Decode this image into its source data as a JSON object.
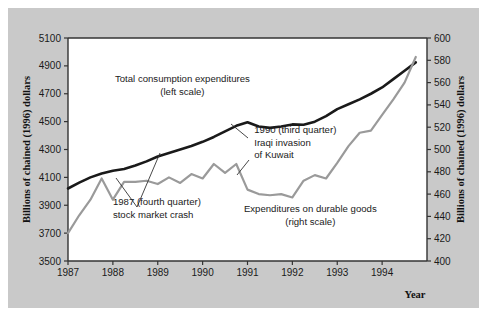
{
  "figure": {
    "background": "#c9c9c9",
    "plot_background": "#ffffff",
    "outer_margin_color": "#ffffff"
  },
  "chart_data": {
    "type": "line",
    "title": "",
    "xlabel": "Year",
    "ylabel": "Billions of chained (1996) dollars",
    "ylabel_right": "Billions of chained (1996) dollars",
    "grid": false,
    "legend": "inline-annotations",
    "xlim": [
      1987,
      1995
    ],
    "xticks": [
      1987,
      1988,
      1989,
      1990,
      1991,
      1992,
      1993,
      1994
    ],
    "xtick_labels": [
      "1987",
      "1988",
      "1989",
      "1990",
      "1991",
      "1992",
      "1993",
      "1994"
    ],
    "ylim": [
      3500,
      5100
    ],
    "yticks": [
      3500,
      3700,
      3900,
      4100,
      4300,
      4500,
      4700,
      4900,
      5100
    ],
    "ytick_labels": [
      "3500",
      "3700",
      "3900",
      "4100",
      "4300",
      "4500",
      "4700",
      "4900",
      "5100"
    ],
    "ylim_right": [
      400,
      600
    ],
    "yticks_right": [
      400,
      420,
      440,
      460,
      480,
      500,
      520,
      540,
      560,
      580,
      600
    ],
    "ytick_labels_right": [
      "400",
      "420",
      "440",
      "460",
      "480",
      "500",
      "520",
      "540",
      "560",
      "580",
      "600"
    ],
    "series": [
      {
        "name": "Total consumption expenditures",
        "axis": "left",
        "color": "#1a1a1a",
        "width": 2.6,
        "x": [
          1987.0,
          1987.25,
          1987.5,
          1987.75,
          1988.0,
          1988.25,
          1988.5,
          1988.75,
          1989.0,
          1989.25,
          1989.5,
          1989.75,
          1990.0,
          1990.25,
          1990.5,
          1990.75,
          1991.0,
          1991.25,
          1991.5,
          1991.75,
          1992.0,
          1992.25,
          1992.5,
          1992.75,
          1993.0,
          1993.25,
          1993.5,
          1993.75,
          1994.0,
          1994.25,
          1994.5,
          1994.75
        ],
        "y": [
          4020,
          4062,
          4100,
          4128,
          4148,
          4160,
          4185,
          4215,
          4250,
          4275,
          4300,
          4325,
          4355,
          4390,
          4430,
          4470,
          4495,
          4465,
          4455,
          4465,
          4480,
          4478,
          4500,
          4540,
          4590,
          4625,
          4660,
          4700,
          4745,
          4805,
          4865,
          4925
        ]
      },
      {
        "name": "Expenditures on durable goods",
        "axis": "right",
        "color": "#9a9a9a",
        "width": 2.2,
        "x": [
          1987.0,
          1987.25,
          1987.5,
          1987.75,
          1988.0,
          1988.25,
          1988.5,
          1988.75,
          1989.0,
          1989.25,
          1989.5,
          1989.75,
          1990.0,
          1990.25,
          1990.5,
          1990.75,
          1991.0,
          1991.25,
          1991.5,
          1991.75,
          1992.0,
          1992.25,
          1992.5,
          1992.75,
          1993.0,
          1993.25,
          1993.5,
          1993.75,
          1994.0,
          1994.25,
          1994.5,
          1994.75
        ],
        "y": [
          425,
          441,
          455,
          474,
          455,
          471,
          471,
          472,
          469,
          475,
          470,
          478,
          474,
          487,
          479,
          487,
          464,
          460,
          459,
          460,
          457,
          472,
          477,
          474,
          488,
          503,
          515,
          517,
          531,
          545,
          560,
          583
        ]
      }
    ],
    "annotations": [
      {
        "name": "total-consumption-label",
        "lines": [
          "Total consumption expenditures",
          "(left scale)"
        ],
        "x": 1989.55,
        "y_px": 82
      },
      {
        "name": "iraqi-invasion-label",
        "lines": [
          "1990 (third quarter)",
          "Iraqi invasion",
          "of Kuwait"
        ],
        "x": 1991.15,
        "y_px": 133
      },
      {
        "name": "stock-market-crash-label",
        "lines": [
          "1987 (fourth quarter)",
          "stock market crash"
        ],
        "x": 1988.0,
        "y_px": 205
      },
      {
        "name": "durable-goods-label",
        "lines": [
          "Expenditures on durable goods",
          "(right scale)"
        ],
        "x": 1992.4,
        "y_px": 212
      }
    ],
    "leader_lines": [
      {
        "name": "leader-iraqi-invasion",
        "x1": 248,
        "y1": 138,
        "x2": 231,
        "y2": 124
      },
      {
        "name": "leader-kuwait-to-curve",
        "x1": 249,
        "y1": 160,
        "x2": 237,
        "y2": 175
      },
      {
        "name": "leader-stock-crash-a",
        "x1": 137,
        "y1": 207,
        "x2": 116,
        "y2": 178
      },
      {
        "name": "leader-stock-crash-b",
        "x1": 137,
        "y1": 207,
        "x2": 160,
        "y2": 153
      }
    ]
  }
}
